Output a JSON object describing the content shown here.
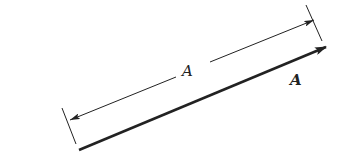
{
  "diagram": {
    "colors": {
      "line": "#222222",
      "background": "#ffffff"
    },
    "magnitude_label": "A",
    "vector_label": "A",
    "vector": {
      "start": [
        79,
        150
      ],
      "end": [
        326,
        47
      ],
      "stroke_width": 2.6
    },
    "dimension_line": {
      "start": [
        76,
        118
      ],
      "end": [
        312,
        21
      ],
      "label_gap_center": [
        188,
        70
      ],
      "stroke_width": 1
    },
    "extension_ticks": [
      {
        "from": [
          62,
          108
        ],
        "to": [
          76,
          144
        ]
      },
      {
        "from": [
          306,
          5
        ],
        "to": [
          322,
          41
        ]
      }
    ]
  }
}
